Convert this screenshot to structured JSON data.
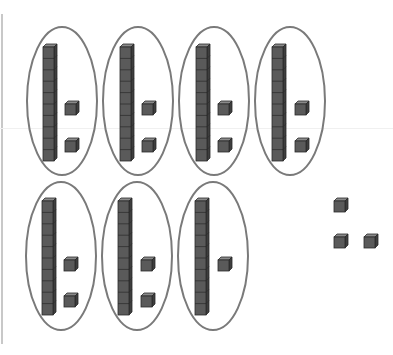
{
  "figure": {
    "colors": {
      "background": "#ffffff",
      "ellipse_stroke": "#7a7a7a",
      "block_fill": "#5a5a5a",
      "block_top": "#8a8a8a",
      "block_side": "#3e3e3e",
      "block_line": "#2a2a2a"
    },
    "groups": [
      {
        "ellipse": {
          "cx": 62,
          "cy": 101,
          "rx": 35,
          "ry": 74
        },
        "rod": {
          "x": 43,
          "y": 44,
          "units": 10
        },
        "ones": [
          {
            "x": 65,
            "y": 101
          },
          {
            "x": 65,
            "y": 138
          }
        ]
      },
      {
        "ellipse": {
          "cx": 138,
          "cy": 101,
          "rx": 35,
          "ry": 74
        },
        "rod": {
          "x": 120,
          "y": 44,
          "units": 10
        },
        "ones": [
          {
            "x": 142,
            "y": 101
          },
          {
            "x": 142,
            "y": 138
          }
        ]
      },
      {
        "ellipse": {
          "cx": 214,
          "cy": 101,
          "rx": 35,
          "ry": 74
        },
        "rod": {
          "x": 196,
          "y": 44,
          "units": 10
        },
        "ones": [
          {
            "x": 218,
            "y": 101
          },
          {
            "x": 218,
            "y": 138
          }
        ]
      },
      {
        "ellipse": {
          "cx": 290,
          "cy": 101,
          "rx": 35,
          "ry": 74
        },
        "rod": {
          "x": 272,
          "y": 44,
          "units": 10
        },
        "ones": [
          {
            "x": 295,
            "y": 101
          },
          {
            "x": 295,
            "y": 138
          }
        ]
      },
      {
        "ellipse": {
          "cx": 61,
          "cy": 256,
          "rx": 35,
          "ry": 74
        },
        "rod": {
          "x": 42,
          "y": 198,
          "units": 10
        },
        "ones": [
          {
            "x": 64,
            "y": 257
          },
          {
            "x": 64,
            "y": 293
          }
        ]
      },
      {
        "ellipse": {
          "cx": 137,
          "cy": 256,
          "rx": 35,
          "ry": 74
        },
        "rod": {
          "x": 118,
          "y": 198,
          "units": 10
        },
        "ones": [
          {
            "x": 141,
            "y": 257
          },
          {
            "x": 141,
            "y": 293
          }
        ]
      },
      {
        "ellipse": {
          "cx": 213,
          "cy": 256,
          "rx": 35,
          "ry": 74
        },
        "rod": {
          "x": 195,
          "y": 198,
          "units": 10
        },
        "ones": [
          {
            "x": 218,
            "y": 257
          }
        ]
      }
    ],
    "loose_ones": [
      {
        "x": 334,
        "y": 198
      },
      {
        "x": 334,
        "y": 234
      },
      {
        "x": 364,
        "y": 234
      }
    ],
    "block_size": 14
  }
}
